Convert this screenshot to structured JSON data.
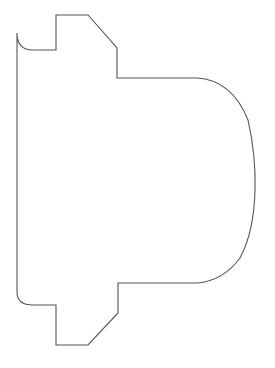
{
  "document": {
    "title": "Shape Outline Drawing",
    "type": "line-drawing",
    "description": "Closed polyline-and-arc outline of a mechanical profile silhouette"
  },
  "canvas": {
    "width": 275,
    "height": 368,
    "background_color": "#ffffff"
  },
  "shape": {
    "name": "profile-outline",
    "stroke_color": "#555555",
    "stroke_width": 1.1,
    "fill": "none",
    "closed": true,
    "path": "M 17 68 L 17 33 Q 17 50 33 50 L 56 50 L 56 15 L 88 15 L 117 48 L 117 78 L 197 78 Q 232 80 248 120 Q 256 155 255 190 Q 254 232 240 258 Q 224 280 198 283 L 118 283 L 118 313 L 88 345 L 56 345 L 56 305 L 33 305 Q 17 305 17 292 Z",
    "segments": [
      {
        "kind": "corner-arc",
        "name": "top-left-round",
        "from": [
          33,
          50
        ],
        "to": [
          17,
          68
        ],
        "radius": 16
      },
      {
        "kind": "line",
        "name": "top-left-horizontal",
        "from": [
          33,
          50
        ],
        "to": [
          56,
          50
        ]
      },
      {
        "kind": "line",
        "name": "top-notch-left-vertical",
        "from": [
          56,
          50
        ],
        "to": [
          56,
          15
        ]
      },
      {
        "kind": "line",
        "name": "top-notch-horizontal",
        "from": [
          56,
          15
        ],
        "to": [
          88,
          15
        ]
      },
      {
        "kind": "line",
        "name": "top-diagonal-chamfer",
        "from": [
          88,
          15
        ],
        "to": [
          117,
          48
        ]
      },
      {
        "kind": "line",
        "name": "top-step-vertical",
        "from": [
          117,
          48
        ],
        "to": [
          117,
          78
        ]
      },
      {
        "kind": "line",
        "name": "top-shoulder-horizontal",
        "from": [
          117,
          78
        ],
        "to": [
          197,
          78
        ]
      },
      {
        "kind": "arc",
        "name": "right-dome-curve",
        "from": [
          197,
          78
        ],
        "to": [
          198,
          283
        ],
        "apex": [
          255,
          190
        ]
      },
      {
        "kind": "line",
        "name": "bottom-shoulder-horizontal",
        "from": [
          198,
          283
        ],
        "to": [
          118,
          283
        ]
      },
      {
        "kind": "line",
        "name": "bottom-step-vertical",
        "from": [
          118,
          283
        ],
        "to": [
          118,
          313
        ]
      },
      {
        "kind": "line",
        "name": "bottom-diagonal-chamfer",
        "from": [
          118,
          313
        ],
        "to": [
          88,
          345
        ]
      },
      {
        "kind": "line",
        "name": "bottom-notch-horizontal",
        "from": [
          88,
          345
        ],
        "to": [
          56,
          345
        ]
      },
      {
        "kind": "line",
        "name": "bottom-notch-left-vertical",
        "from": [
          56,
          345
        ],
        "to": [
          56,
          305
        ]
      },
      {
        "kind": "line",
        "name": "bottom-left-horizontal",
        "from": [
          56,
          305
        ],
        "to": [
          33,
          305
        ]
      },
      {
        "kind": "corner-arc",
        "name": "bottom-left-round",
        "from": [
          33,
          305
        ],
        "to": [
          17,
          292
        ],
        "radius": 16
      },
      {
        "kind": "line",
        "name": "left-vertical-edge",
        "from": [
          17,
          292
        ],
        "to": [
          17,
          68
        ]
      }
    ],
    "bounds": {
      "left": 17,
      "top": 15,
      "right": 255,
      "bottom": 345
    }
  }
}
